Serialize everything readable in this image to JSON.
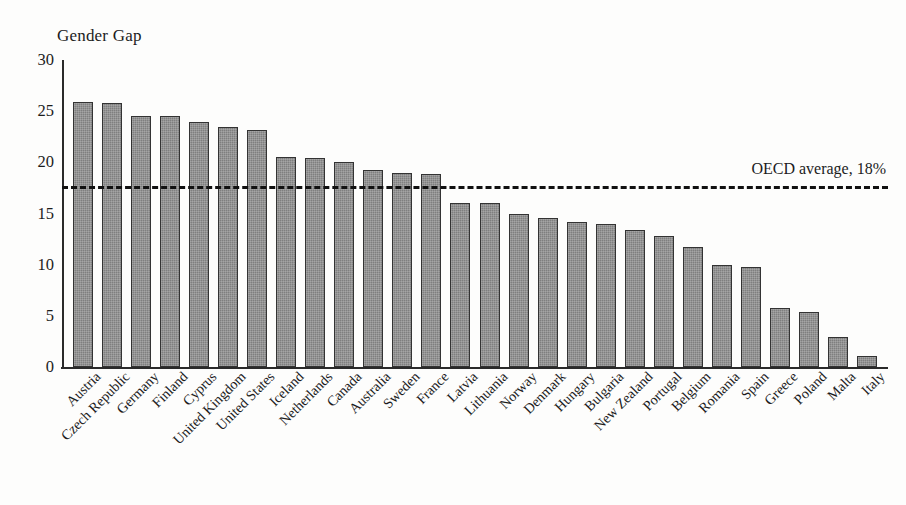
{
  "chart_data": {
    "type": "bar",
    "title": "Gender Gap",
    "xlabel": "",
    "ylabel": "",
    "ylim": [
      0,
      30
    ],
    "yticks": [
      0,
      5,
      10,
      15,
      20,
      25,
      30
    ],
    "grid": false,
    "legend": null,
    "bar_color": "#7f7f7f",
    "bar_edge_color": "#333333",
    "categories": [
      "Austria",
      "Czech Republic",
      "Germany",
      "Finland",
      "Cyprus",
      "United Kingdom",
      "United States",
      "Iceland",
      "Netherlands",
      "Canada",
      "Australia",
      "Sweden",
      "France",
      "Latvia",
      "Lithuania",
      "Norway",
      "Denmark",
      "Hungary",
      "Bulgaria",
      "New Zealand",
      "Portugal",
      "Belgium",
      "Romania",
      "Spain",
      "Greece",
      "Poland",
      "Malta",
      "Italy"
    ],
    "values": [
      25.9,
      25.8,
      24.5,
      24.5,
      23.9,
      23.5,
      23.2,
      20.5,
      20.4,
      20.0,
      19.3,
      19.0,
      18.9,
      16.0,
      16.0,
      15.0,
      14.6,
      14.2,
      14.0,
      13.4,
      12.8,
      11.7,
      10.0,
      9.8,
      5.8,
      5.4,
      2.9,
      1.1
    ],
    "annotations": [
      {
        "name": "oecd-average-line",
        "label": "OECD average, 18%",
        "value": 18,
        "style": "dashed",
        "color": "#111111"
      }
    ]
  }
}
